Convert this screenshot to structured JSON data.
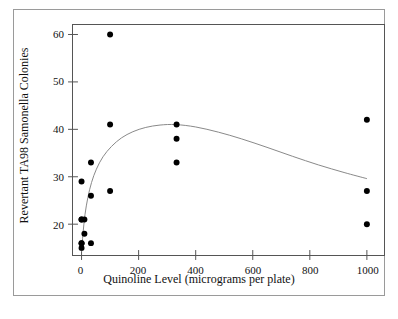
{
  "figure": {
    "background_color": "#ffffff",
    "border_color": "#9a9a9a",
    "axes_color": "#555555",
    "marker_color": "#000000",
    "curve_color": "#888888"
  },
  "chart_data": {
    "type": "scatter",
    "title": "",
    "xlabel": "Quinoline Level (micrograms per plate)",
    "ylabel": "Revertant TA98 Samonella Colonies",
    "xlim": [
      -30,
      1060
    ],
    "ylim": [
      13.5,
      62
    ],
    "xticks": [
      0,
      200,
      400,
      600,
      800,
      1000
    ],
    "xticklabels": [
      "0",
      "200",
      "400",
      "600",
      "800",
      "1000"
    ],
    "yticks": [
      20,
      30,
      40,
      50,
      60
    ],
    "yticklabels": [
      "20",
      "30",
      "40",
      "50",
      "60"
    ],
    "grid": false,
    "legend": null,
    "series": [
      {
        "name": "Revertant colony counts",
        "type": "scatter",
        "marker": "filled-circle",
        "color": "#000000",
        "points": [
          {
            "x": 0,
            "y": 15
          },
          {
            "x": 0,
            "y": 16
          },
          {
            "x": 0,
            "y": 16
          },
          {
            "x": 0,
            "y": 21
          },
          {
            "x": 0,
            "y": 21
          },
          {
            "x": 0,
            "y": 29
          },
          {
            "x": 10,
            "y": 18
          },
          {
            "x": 10,
            "y": 21
          },
          {
            "x": 33,
            "y": 16
          },
          {
            "x": 33,
            "y": 26
          },
          {
            "x": 33,
            "y": 33
          },
          {
            "x": 100,
            "y": 27
          },
          {
            "x": 100,
            "y": 41
          },
          {
            "x": 100,
            "y": 60
          },
          {
            "x": 333,
            "y": 33
          },
          {
            "x": 333,
            "y": 38
          },
          {
            "x": 333,
            "y": 41
          },
          {
            "x": 1000,
            "y": 20
          },
          {
            "x": 1000,
            "y": 27
          },
          {
            "x": 1000,
            "y": 42
          }
        ]
      },
      {
        "name": "Fitted smooth curve",
        "type": "line",
        "color": "#888888",
        "points": [
          {
            "x": 0,
            "y": 14.2
          },
          {
            "x": 5,
            "y": 18.0
          },
          {
            "x": 12,
            "y": 22.0
          },
          {
            "x": 22,
            "y": 25.6
          },
          {
            "x": 35,
            "y": 28.8
          },
          {
            "x": 52,
            "y": 31.6
          },
          {
            "x": 75,
            "y": 34.2
          },
          {
            "x": 105,
            "y": 36.4
          },
          {
            "x": 140,
            "y": 38.2
          },
          {
            "x": 180,
            "y": 39.5
          },
          {
            "x": 225,
            "y": 40.4
          },
          {
            "x": 275,
            "y": 40.9
          },
          {
            "x": 330,
            "y": 41.0
          },
          {
            "x": 400,
            "y": 40.5
          },
          {
            "x": 480,
            "y": 39.4
          },
          {
            "x": 560,
            "y": 38.0
          },
          {
            "x": 650,
            "y": 36.2
          },
          {
            "x": 740,
            "y": 34.3
          },
          {
            "x": 830,
            "y": 32.5
          },
          {
            "x": 920,
            "y": 30.9
          },
          {
            "x": 1000,
            "y": 29.6
          }
        ]
      }
    ]
  }
}
